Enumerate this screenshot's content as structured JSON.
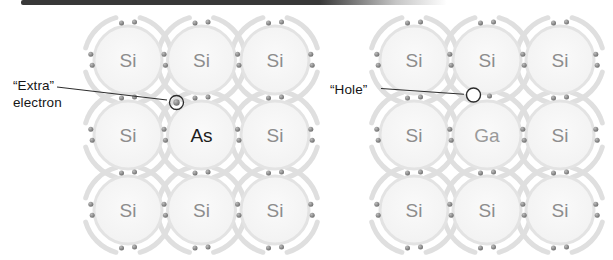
{
  "figure": {
    "background": "#ffffff",
    "top_bar": {
      "color": "#383838"
    },
    "colors": {
      "halo": "#dcdcdc",
      "atom_fill_center": "#fafafa",
      "atom_fill_edge": "#f1f1f1",
      "atom_stroke": "#e3e3e3",
      "electron_light": "#bdbdbd",
      "electron_dark": "#6a6a6a",
      "annotation": "#2e2e2e",
      "marker_stroke": "#2b2b2b"
    },
    "element_colors": {
      "Si": "#8d8d8d",
      "As": "#1c1c1c",
      "Ga": "#9a9a9a"
    },
    "diagrams": [
      {
        "id": "n-type-lattice",
        "dopant": "As",
        "cols": [
          128,
          201.5,
          275
        ],
        "rows": [
          60,
          135,
          210
        ],
        "elements": [
          [
            "Si",
            "Si",
            "Si"
          ],
          [
            "Si",
            "As",
            "Si"
          ],
          [
            "Si",
            "Si",
            "Si"
          ]
        ],
        "marker": {
          "type": "extra-electron",
          "x": 176.5,
          "y": 102.5,
          "dot_r": 3.2,
          "ring_r": 7
        }
      },
      {
        "id": "p-type-lattice",
        "dopant": "Ga",
        "cols": [
          414,
          487,
          560
        ],
        "rows": [
          60,
          135,
          210
        ],
        "elements": [
          [
            "Si",
            "Si",
            "Si"
          ],
          [
            "Si",
            "Ga",
            "Si"
          ],
          [
            "Si",
            "Si",
            "Si"
          ]
        ],
        "marker": {
          "type": "hole",
          "x": 473.5,
          "y": 95,
          "ring_r": 7,
          "companion_dot": {
            "x": 489.5,
            "y": 96
          }
        },
        "omit_bond": {
          "colIndex": 1,
          "gapIndex": 1
        }
      }
    ],
    "annotations": [
      {
        "id": "extra-electron",
        "lines": [
          "“Extra”",
          "electron"
        ],
        "x": 13,
        "y": 78,
        "leader": {
          "x1": 57,
          "y1": 87,
          "x2": 167,
          "y2": 100
        }
      },
      {
        "id": "hole",
        "lines": [
          "“Hole”"
        ],
        "x": 330,
        "y": 82,
        "leader": {
          "x1": 381,
          "y1": 88.5,
          "x2": 464,
          "y2": 94.3
        }
      }
    ]
  }
}
